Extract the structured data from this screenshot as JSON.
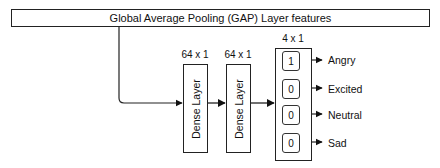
{
  "diagram": {
    "input_box": {
      "label": "Global Average Pooling (GAP) Layer  features"
    },
    "layers": [
      {
        "name": "Dense Layer",
        "shape": "64 x 1"
      },
      {
        "name": "Dense Layer",
        "shape": "64 x 1"
      }
    ],
    "output": {
      "shape": "4 x 1",
      "cells": [
        {
          "value": "1",
          "label": "Angry"
        },
        {
          "value": "0",
          "label": "Excited"
        },
        {
          "value": "0",
          "label": "Neutral"
        },
        {
          "value": "0",
          "label": "Sad"
        }
      ]
    },
    "colors": {
      "stroke": "#222222",
      "background": "#ffffff",
      "text": "#111111"
    }
  }
}
